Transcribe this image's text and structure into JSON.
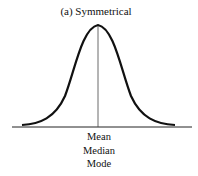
{
  "diagram": {
    "title": "(a) Symmetrical",
    "center_labels": [
      "Mean",
      "Median",
      "Mode"
    ],
    "curve": "symmetric bell-shaped distribution with vertical line at center",
    "colors": {
      "line": "#111111",
      "background": "#ffffff"
    }
  }
}
